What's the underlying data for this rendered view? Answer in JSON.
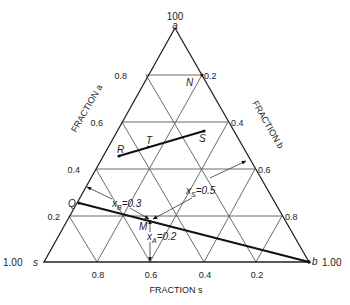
{
  "diagram": {
    "type": "ternary-diagram",
    "vertices": {
      "top": {
        "label": "a",
        "value": "100"
      },
      "bottom_left": {
        "label": "s",
        "value": "1.00"
      },
      "bottom_right": {
        "label": "b",
        "value": "1.00"
      }
    },
    "axes": {
      "left": {
        "title": "FRACTION a",
        "ticks": [
          "0.8",
          "0.6",
          "0.4",
          "0.2"
        ]
      },
      "right": {
        "title": "FRACTION b",
        "ticks": [
          "0.2",
          "0.4",
          "0.6",
          "0.8"
        ]
      },
      "bottom": {
        "title": "FRACTION s",
        "ticks": [
          "0.8",
          "0.6",
          "0.4",
          "0.2"
        ]
      }
    },
    "points": {
      "N": "N",
      "R": "R",
      "T": "T",
      "S": "S",
      "Q": "Q",
      "M": "M"
    },
    "annotations": {
      "xB": {
        "var": "x",
        "sub": "B",
        "value": "=0.3"
      },
      "xS": {
        "var": "x",
        "sub": "S",
        "value": "=0.5"
      },
      "xA": {
        "var": "x",
        "sub": "A",
        "value": "=0.2"
      }
    }
  }
}
